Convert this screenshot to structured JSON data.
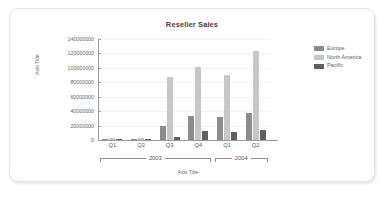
{
  "card": {
    "background": "#ffffff",
    "border_color": "#e3e3e3"
  },
  "chart_data": {
    "type": "bar",
    "title": "Reseller Sales",
    "xlabel": "Axis Title",
    "ylabel": "Axis Title",
    "categories": [
      "Q1",
      "Q2",
      "Q3",
      "Q4",
      "Q1",
      "Q2"
    ],
    "group_labels": [
      "2003",
      "2004"
    ],
    "group_spans": [
      4,
      2
    ],
    "series": [
      {
        "name": "Europe",
        "color": "#8c8c8c",
        "values": [
          300000,
          600000,
          20000000,
          33000000,
          32000000,
          38000000
        ]
      },
      {
        "name": "North America",
        "color": "#c6c6c6",
        "values": [
          3000000,
          3200000,
          88000000,
          101000000,
          90000000,
          124000000
        ]
      },
      {
        "name": "Pacific",
        "color": "#5f5f5f",
        "values": [
          200000,
          300000,
          4000000,
          12000000,
          11000000,
          14000000
        ]
      }
    ],
    "ylim": [
      0,
      140000000
    ],
    "ytick_values": [
      0,
      20000000,
      40000000,
      60000000,
      80000000,
      100000000,
      120000000,
      140000000
    ],
    "ytick_labels": [
      "0",
      "20000000",
      "40000000",
      "60000000",
      "80000000",
      "100000000",
      "120000000",
      "140000000"
    ],
    "grid": true,
    "legend_position": "right"
  }
}
